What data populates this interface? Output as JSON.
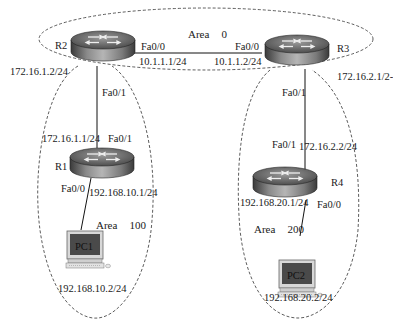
{
  "areas": [
    {
      "id": "area0",
      "label": "Area",
      "number": "0"
    },
    {
      "id": "area100",
      "label": "Area",
      "number": "100"
    },
    {
      "id": "area200",
      "label": "Area",
      "number": "200"
    }
  ],
  "devices": {
    "R1": {
      "type": "router",
      "label": "R1"
    },
    "R2": {
      "type": "router",
      "label": "R2"
    },
    "R3": {
      "type": "router",
      "label": "R3"
    },
    "R4": {
      "type": "router",
      "label": "R4"
    },
    "PC1": {
      "type": "pc",
      "label": "PC1"
    },
    "PC2": {
      "type": "pc",
      "label": "PC2"
    }
  },
  "interfaces": {
    "R2_fa00": {
      "name": "Fa0/0",
      "ip": "10.1.1.1/24"
    },
    "R3_fa00": {
      "name": "Fa0/0",
      "ip": "10.1.1.2/24"
    },
    "R2_fa01": {
      "name": "Fa0/1",
      "ip": "172.16.1.2/24"
    },
    "R1_fa01": {
      "name": "Fa0/1",
      "ip": "172.16.1.1/24"
    },
    "R1_fa00": {
      "name": "Fa0/0",
      "ip": "192.168.10.1/24"
    },
    "R3_fa01": {
      "name": "Fa0/1",
      "ip": "172.16.2.1/24"
    },
    "R4_fa01": {
      "name": "Fa0/1",
      "ip": "172.16.2.2/24"
    },
    "R4_fa00": {
      "name": "Fa0/0",
      "ip": "192.168.20.1/24"
    },
    "PC1_nic": {
      "ip": "192.168.10.2/24"
    },
    "PC2_nic": {
      "ip": "192.168.20.2/24"
    }
  },
  "links": [
    {
      "from": "R2",
      "to": "R3",
      "network": "10.1.1.0/24"
    },
    {
      "from": "R2",
      "to": "R1",
      "network": "172.16.1.0/24"
    },
    {
      "from": "R3",
      "to": "R4",
      "network": "172.16.2.0/24"
    },
    {
      "from": "R1",
      "to": "PC1",
      "network": "192.168.10.0/24"
    },
    {
      "from": "R4",
      "to": "PC2",
      "network": "192.168.20.0/24"
    }
  ],
  "display": {
    "R3_fa01_ip_visible": "172.16.2.1/2-",
    "R4_fa01_ip_visible": "172.16.2.2/24"
  }
}
